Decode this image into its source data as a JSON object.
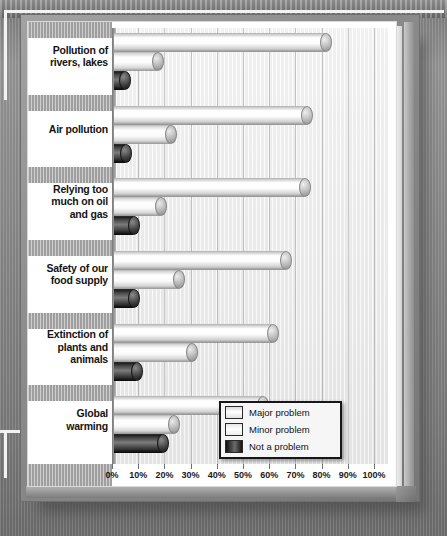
{
  "chart_data": {
    "type": "bar",
    "orientation": "horizontal",
    "title": "",
    "xlabel": "",
    "ylabel": "",
    "xlim": [
      0,
      100
    ],
    "xtick_labels": [
      "0%",
      "10%",
      "20%",
      "30%",
      "40%",
      "50%",
      "60%",
      "70%",
      "80%",
      "90%",
      "100%"
    ],
    "xtick_values": [
      0,
      10,
      20,
      30,
      40,
      50,
      60,
      70,
      80,
      90,
      100
    ],
    "grid": true,
    "legend_position": "inside-bottom-right",
    "categories": [
      "Pollution of rivers, lakes",
      "Air pollution",
      "Relying too much on oil and gas",
      "Safety of our food supply",
      "Extinction of plants and animals",
      "Global warming"
    ],
    "series": [
      {
        "name": "Major problem",
        "values": [
          80,
          73,
          72,
          65,
          60,
          56
        ]
      },
      {
        "name": "Minor problem",
        "values": [
          16,
          21,
          17,
          24,
          29,
          22
        ]
      },
      {
        "name": "Not a problem",
        "values": [
          3,
          4,
          7,
          7,
          8,
          18
        ]
      }
    ]
  },
  "categories_display": [
    {
      "lines": [
        "Pollution of",
        "rivers, lakes"
      ]
    },
    {
      "lines": [
        "Air pollution"
      ]
    },
    {
      "lines": [
        "Relying too",
        "much on oil",
        "and gas"
      ]
    },
    {
      "lines": [
        "Safety of our",
        "food supply"
      ]
    },
    {
      "lines": [
        "Extinction of",
        "plants and",
        "animals"
      ]
    },
    {
      "lines": [
        "Global",
        "warming"
      ]
    }
  ],
  "legend": {
    "items": [
      {
        "label": "Major problem",
        "key": "major"
      },
      {
        "label": "Minor problem",
        "key": "minor"
      },
      {
        "label": "Not a problem",
        "key": "none"
      }
    ]
  },
  "colors": {
    "major_fill": "#ffffff",
    "minor_fill": "#f7f7f7",
    "none_fill": "#1a1a1a",
    "panel": "#ffffff",
    "frame": "#8b8b8b",
    "background": "#8a8a8a",
    "band": "#a7a7a7",
    "axis_text": "#1a1a1a"
  }
}
